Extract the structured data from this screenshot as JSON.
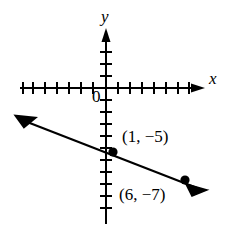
{
  "figure": {
    "type": "coordinate-plane-line-graph",
    "axes": {
      "x_label": "x",
      "y_label": "y",
      "origin_label": "0",
      "x_tick_count_left": 7,
      "x_tick_count_right": 7,
      "y_tick_count_above": 3,
      "y_tick_count_below": 9,
      "tick_spacing_px": 12,
      "arrowheads": [
        "x-positive",
        "y-positive"
      ]
    },
    "line": {
      "style": "solid",
      "arrowheads": [
        "left",
        "right"
      ],
      "slope": -0.4,
      "points": [
        {
          "label": "(1, −5)",
          "x": 1,
          "y": -5
        },
        {
          "label": "(6, −7)",
          "x": 6,
          "y": -7
        }
      ]
    },
    "colors": {
      "stroke": "#000000",
      "background": "#ffffff"
    }
  }
}
